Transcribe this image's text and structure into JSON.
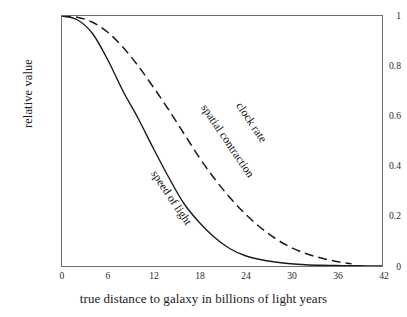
{
  "chart_data": {
    "type": "line",
    "title": "",
    "xlabel": "true distance to galaxy in billions of light years",
    "ylabel": "relative value",
    "xlim": [
      0,
      42
    ],
    "ylim": [
      0,
      1
    ],
    "grid": false,
    "legend_position": "inline-annotations",
    "xticks": [
      "0",
      "6",
      "12",
      "18",
      "24",
      "30",
      "36",
      "42"
    ],
    "yticks": [
      "0",
      "0.2",
      "0.4",
      "0.6",
      "0.8",
      "1"
    ],
    "x": [
      0,
      2,
      4,
      6,
      8,
      10,
      12,
      14,
      16,
      18,
      20,
      22,
      24,
      26,
      28,
      30,
      32,
      34,
      36,
      38,
      40,
      42
    ],
    "series": [
      {
        "name": "speed of light",
        "style": "solid",
        "color": "#1a1a1a",
        "values": [
          1.0,
          0.985,
          0.93,
          0.825,
          0.7,
          0.59,
          0.47,
          0.355,
          0.25,
          0.175,
          0.115,
          0.07,
          0.042,
          0.026,
          0.016,
          0.009,
          0.005,
          0.003,
          0.002,
          0.001,
          0.0005,
          0.0
        ]
      },
      {
        "name": "spatial contraction",
        "style": "dashed",
        "color": "#1a1a1a",
        "values": [
          1.0,
          0.995,
          0.975,
          0.935,
          0.875,
          0.8,
          0.715,
          0.625,
          0.53,
          0.435,
          0.35,
          0.275,
          0.21,
          0.155,
          0.11,
          0.075,
          0.05,
          0.032,
          0.018,
          0.009,
          0.004,
          0.0
        ]
      },
      {
        "name": "clock rate",
        "style": "dashed",
        "color": "#1a1a1a",
        "values": [
          1.0,
          0.995,
          0.975,
          0.935,
          0.875,
          0.8,
          0.715,
          0.625,
          0.53,
          0.435,
          0.35,
          0.275,
          0.21,
          0.155,
          0.11,
          0.075,
          0.05,
          0.032,
          0.018,
          0.009,
          0.004,
          0.0
        ]
      }
    ],
    "annotations": [
      {
        "text": "clock rate",
        "curve": "clock rate"
      },
      {
        "text": "spatial contraction",
        "curve": "spatial contraction"
      },
      {
        "text": "speed of light",
        "curve": "speed of light"
      }
    ]
  },
  "axes": {
    "y_label": "relative value",
    "x_label": "true distance to galaxy in billions of light years",
    "y_ticks": [
      {
        "value": "1"
      },
      {
        "value": "0.8"
      },
      {
        "value": "0.6"
      },
      {
        "value": "0.4"
      },
      {
        "value": "0.2"
      },
      {
        "value": "0"
      }
    ],
    "x_ticks": [
      {
        "value": "0"
      },
      {
        "value": "6"
      },
      {
        "value": "12"
      },
      {
        "value": "18"
      },
      {
        "value": "24"
      },
      {
        "value": "30"
      },
      {
        "value": "36"
      },
      {
        "value": "42"
      }
    ]
  },
  "annotations": {
    "clock_rate": "clock rate",
    "spatial_contraction": "spatial contraction",
    "speed_of_light": "speed of light"
  },
  "colors": {
    "curve": "#1a1a1a",
    "frame": "#6e6e6e",
    "background": "#ffffff"
  }
}
